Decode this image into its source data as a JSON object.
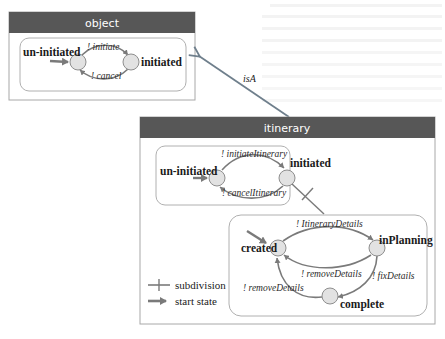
{
  "colors": {
    "header_bg": "#575757",
    "header_text": "#ffffff",
    "box_border": "#a8a8a8",
    "inner_border": "#b0b0b0",
    "state_fill": "#e2e2e2",
    "state_stroke": "#8e8e8e",
    "arrow": "#7a7a7a",
    "isa_arrow": "#6f7f8c"
  },
  "object_class": {
    "title": "object",
    "states": [
      {
        "name": "un-initiated",
        "start": true
      },
      {
        "name": "initiated",
        "start": false
      }
    ],
    "transitions": [
      {
        "label": "! initiate",
        "from": "un-initiated",
        "to": "initiated"
      },
      {
        "label": "! cancel",
        "from": "initiated",
        "to": "un-initiated"
      }
    ]
  },
  "relationship": {
    "label": "isA",
    "from": "itinerary",
    "to": "object"
  },
  "itinerary_class": {
    "title": "itinerary",
    "top_machine": {
      "states": [
        {
          "name": "un-initiated",
          "start": true
        },
        {
          "name": "initiated",
          "start": false
        }
      ],
      "transitions": [
        {
          "label": "! initiateItinerary",
          "from": "un-initiated",
          "to": "initiated"
        },
        {
          "label": "! cancelItinerary",
          "from": "initiated",
          "to": "un-initiated"
        }
      ]
    },
    "sub_machine": {
      "parent_state": "initiated",
      "states": [
        {
          "name": "created",
          "start": true
        },
        {
          "name": "inPlanning",
          "start": false
        },
        {
          "name": "complete",
          "start": false
        }
      ],
      "transitions": [
        {
          "label": "! ItineraryDetails",
          "from": "created",
          "to": "inPlanning"
        },
        {
          "label": "! removeDetails",
          "from": "inPlanning",
          "to": "created"
        },
        {
          "label": "! fixDetails",
          "from": "inPlanning",
          "to": "complete"
        },
        {
          "label": "! removeDetails",
          "from": "complete",
          "to": "created"
        }
      ]
    }
  },
  "legend": {
    "items": [
      {
        "symbol": "subdivision",
        "label": "subdivision"
      },
      {
        "symbol": "start-state-arrow",
        "label": "start state"
      }
    ]
  }
}
